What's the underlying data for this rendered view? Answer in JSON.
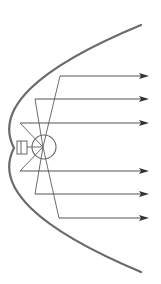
{
  "diagram": {
    "title": "",
    "colors": {
      "reflector": "#6b6b6b",
      "ray": "#555555",
      "arrowhead": "#333333",
      "background": "#ffffff"
    },
    "reflector": {
      "shape": "parabola",
      "vertex": [
        14,
        148
      ],
      "top_end": [
        141,
        25
      ],
      "bottom_end": [
        141,
        272
      ]
    },
    "focus": {
      "cx": 43,
      "cy": 147,
      "bulb_radius": 12
    },
    "filament": {
      "x": 17,
      "y": 141,
      "width": 10,
      "height": 13
    },
    "rays": [
      {
        "id": "ray-1",
        "reflect_x": 60,
        "y": 76
      },
      {
        "id": "ray-2",
        "reflect_x": 35,
        "y": 99
      },
      {
        "id": "ray-3",
        "reflect_x": 20,
        "y": 123
      },
      {
        "id": "ray-4",
        "reflect_x": 20,
        "y": 171
      },
      {
        "id": "ray-5",
        "reflect_x": 35,
        "y": 194
      },
      {
        "id": "ray-6",
        "reflect_x": 59,
        "y": 218
      }
    ],
    "arrow_tip_x": 149
  }
}
